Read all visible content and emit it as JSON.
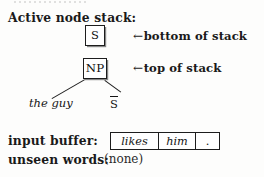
{
  "figure": {
    "type": "parser-state-diagram",
    "background_color": "#fdfdfc",
    "ink_color": "#1a1a1a"
  },
  "active_stack": {
    "label": "Active node stack:",
    "nodes": [
      {
        "symbol": "S",
        "position": "bottom",
        "annotation_arrow": "←",
        "annotation_text": "bottom of stack"
      },
      {
        "symbol": "NP",
        "position": "top",
        "annotation_arrow": "←",
        "annotation_text": "top of stack"
      }
    ],
    "annotations": {
      "bottom_arrow_glyph": "←",
      "bottom_arrow_label": "bottom of stack",
      "top_arrow_glyph": "←",
      "top_arrow_label": "top of stack"
    }
  },
  "tree": {
    "parent": "NP",
    "children": [
      {
        "text": "the guy",
        "style": "italic"
      },
      {
        "text": "S",
        "style": "overbar",
        "rendered": "S̄"
      }
    ]
  },
  "input_buffer": {
    "label": "input buffer:",
    "cells": [
      {
        "text": "likes",
        "style": "italic"
      },
      {
        "text": "him",
        "style": "italic"
      },
      {
        "text": ".",
        "style": "roman"
      }
    ]
  },
  "unseen_words": {
    "label": "unseen words:",
    "value": "(none)"
  }
}
